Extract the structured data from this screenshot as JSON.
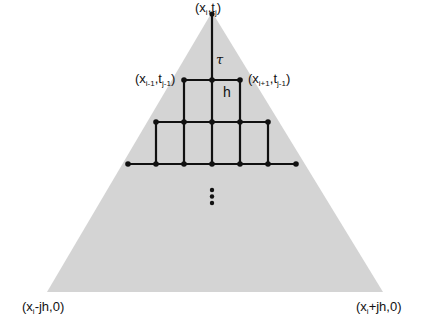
{
  "diagram": {
    "colors": {
      "fill": "#d4d4d4",
      "line": "#111111",
      "background": "#ffffff"
    },
    "labels": {
      "apex": {
        "x": "x",
        "x_sub": "i",
        "t": "t",
        "t_sub": "j"
      },
      "left_point": {
        "x": "x",
        "x_sub": "i-1",
        "t": "t",
        "t_sub": "j-1"
      },
      "right_point": {
        "x": "x",
        "x_sub": "i+1",
        "t": "t",
        "t_sub": "j-1"
      },
      "bottom_left": {
        "x": "x",
        "x_sub": "i",
        "rest": "-jh,0"
      },
      "bottom_right": {
        "x": "x",
        "x_sub": "i",
        "rest": "+jh,0"
      },
      "tau": "τ",
      "h": "h",
      "ellipsis": "⋮"
    },
    "punct": {
      "open": "(",
      "comma": ",",
      "close": ")"
    }
  }
}
